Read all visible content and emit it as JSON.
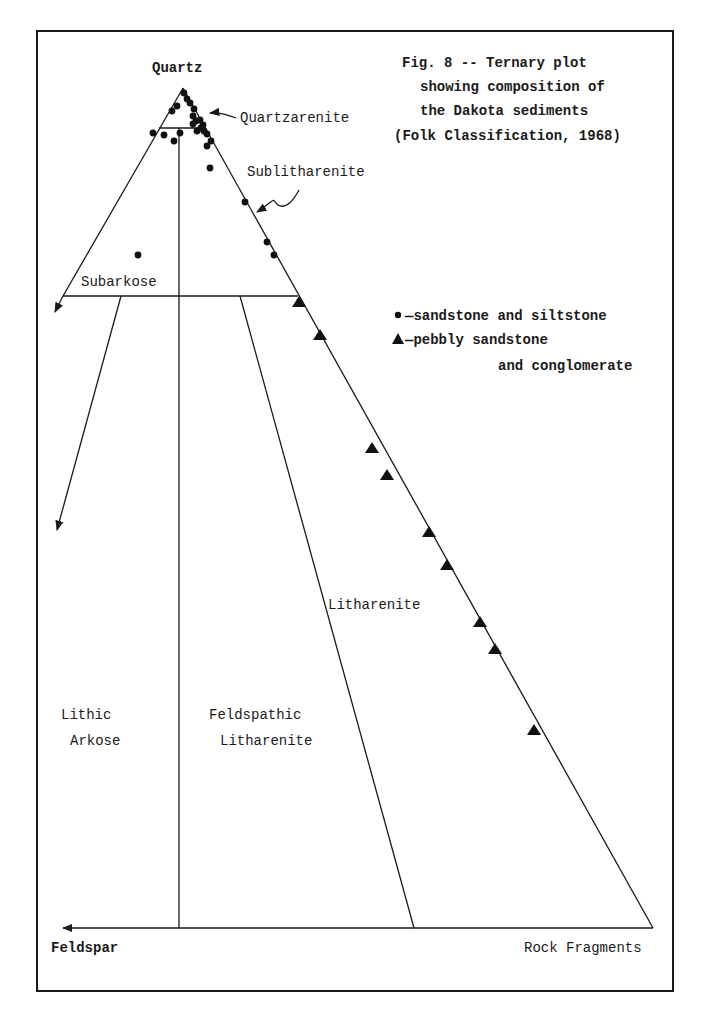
{
  "figure": {
    "title_lines": [
      "Fig. 8 -- Ternary plot",
      "showing composition of",
      "the Dakota sediments",
      "(Folk Classification, 1968)"
    ]
  },
  "apices": {
    "top": "Quartz",
    "bottom_left": "Feldspar",
    "bottom_right": "Rock Fragments"
  },
  "fields": {
    "quartzarenite": "Quartzarenite",
    "sublitharenite": "Sublitharenite",
    "subarkose": "Subarkose",
    "litharenite": "Litharenite",
    "lithic_arkose_1": "Lithic",
    "lithic_arkose_2": "Arkose",
    "feldspathic_litharenite_1": "Feldspathic",
    "feldspathic_litharenite_2": "Litharenite"
  },
  "legend": {
    "items": [
      {
        "symbol": "circle",
        "label": "—sandstone and siltstone"
      },
      {
        "symbol": "triangle",
        "label": "—pebbly sandstone",
        "label2": "and conglomerate"
      }
    ]
  },
  "chart_data": {
    "type": "scatter",
    "subtype": "ternary",
    "title": "Fig. 8 -- Ternary plot showing composition of the Dakota sediments (Folk Classification, 1968)",
    "axes": {
      "top": "Quartz",
      "left": "Feldspar",
      "right": "Rock Fragments"
    },
    "classification_fields": [
      "Quartzarenite",
      "Sublitharenite",
      "Subarkose",
      "Litharenite",
      "Lithic Arkose",
      "Feldspathic Litharenite"
    ],
    "grid": false,
    "legend_position": "right",
    "series": [
      {
        "name": "sandstone and siltstone",
        "marker": "circle",
        "points_px": [
          [
            184,
            93
          ],
          [
            187,
            99
          ],
          [
            190,
            103
          ],
          [
            177,
            106
          ],
          [
            172,
            111
          ],
          [
            194,
            109
          ],
          [
            193,
            116
          ],
          [
            196,
            121
          ],
          [
            193,
            124
          ],
          [
            200,
            120
          ],
          [
            203,
            125
          ],
          [
            197,
            131
          ],
          [
            204,
            131
          ],
          [
            207,
            134
          ],
          [
            201,
            128
          ],
          [
            153,
            133
          ],
          [
            164,
            135
          ],
          [
            174,
            141
          ],
          [
            180,
            133
          ],
          [
            211,
            141
          ],
          [
            207,
            146
          ],
          [
            210,
            168
          ],
          [
            245,
            202
          ],
          [
            267,
            242
          ],
          [
            274,
            255
          ],
          [
            138,
            255
          ]
        ]
      },
      {
        "name": "pebbly sandstone and conglomerate",
        "marker": "triangle",
        "points_px": [
          [
            299,
            302
          ],
          [
            320,
            335
          ],
          [
            372,
            448
          ],
          [
            387,
            475
          ],
          [
            429,
            532
          ],
          [
            447,
            565
          ],
          [
            480,
            622
          ],
          [
            495,
            649
          ],
          [
            534,
            730
          ]
        ]
      }
    ]
  }
}
